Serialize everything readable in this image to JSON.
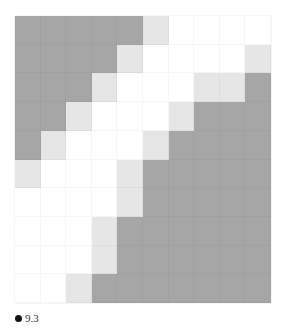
{
  "board": {
    "rows": 10,
    "cols": 10,
    "colors": {
      "d": "#a6a6a6",
      "l": "#e6e6e6",
      "w": "#ffffff"
    },
    "cells": [
      [
        "d",
        "d",
        "d",
        "d",
        "d",
        "l",
        "w",
        "w",
        "w",
        "w"
      ],
      [
        "d",
        "d",
        "d",
        "d",
        "l",
        "w",
        "w",
        "w",
        "w",
        "l"
      ],
      [
        "d",
        "d",
        "d",
        "l",
        "w",
        "w",
        "w",
        "l",
        "l",
        "d"
      ],
      [
        "d",
        "d",
        "l",
        "w",
        "w",
        "w",
        "l",
        "d",
        "d",
        "d"
      ],
      [
        "d",
        "l",
        "w",
        "w",
        "w",
        "l",
        "d",
        "d",
        "d",
        "d"
      ],
      [
        "l",
        "w",
        "w",
        "w",
        "l",
        "d",
        "d",
        "d",
        "d",
        "d"
      ],
      [
        "w",
        "w",
        "w",
        "w",
        "l",
        "d",
        "d",
        "d",
        "d",
        "d"
      ],
      [
        "w",
        "w",
        "w",
        "l",
        "d",
        "d",
        "d",
        "d",
        "d",
        "d"
      ],
      [
        "w",
        "w",
        "w",
        "l",
        "d",
        "d",
        "d",
        "d",
        "d",
        "d"
      ],
      [
        "w",
        "w",
        "l",
        "d",
        "d",
        "d",
        "d",
        "d",
        "d",
        "d"
      ]
    ]
  },
  "status": {
    "icon": "black-dot-icon",
    "value": "9.3"
  }
}
